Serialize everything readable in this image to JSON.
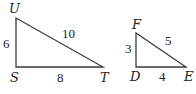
{
  "diagram": {
    "triangles": [
      {
        "name": "UST",
        "right_angle_at": "S",
        "vertices": {
          "top": "U",
          "bottom_left": "S",
          "bottom_right": "T"
        },
        "sides": {
          "US": "6",
          "ST": "8",
          "UT": "10"
        }
      },
      {
        "name": "FDE",
        "right_angle_at": "D",
        "vertices": {
          "top": "F",
          "bottom_left": "D",
          "bottom_right": "E"
        },
        "sides": {
          "FD": "3",
          "DE": "4",
          "FE": "5"
        }
      }
    ]
  }
}
